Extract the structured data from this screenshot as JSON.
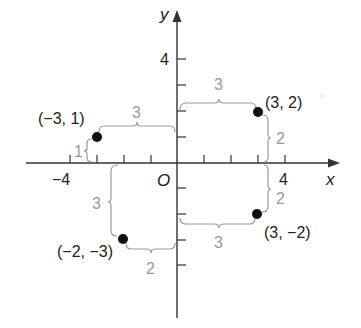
{
  "axes": {
    "x_label": "x",
    "y_label": "y",
    "origin_label": "O",
    "x_tick_labels": [
      {
        "value": -4,
        "text": "−4"
      },
      {
        "value": 4,
        "text": "4"
      }
    ],
    "y_tick_labels": [
      {
        "value": 4,
        "text": "4"
      }
    ],
    "x_range": [
      -5,
      5
    ],
    "y_range": [
      -6,
      5
    ],
    "tick_step": 1
  },
  "points": [
    {
      "x": -3,
      "y": 1,
      "label": "(−3, 1)"
    },
    {
      "x": 3,
      "y": 2,
      "label": "(3, 2)"
    },
    {
      "x": 3,
      "y": -2,
      "label": "(3, −2)"
    },
    {
      "x": -2,
      "y": -3,
      "label": "(−2, −3)"
    }
  ],
  "distance_labels": {
    "p1_horizontal": "3",
    "p1_vertical": "1",
    "p2_horizontal": "3",
    "p2_vertical": "2",
    "p3_horizontal": "3",
    "p3_vertical": "2",
    "p4_horizontal": "2",
    "p4_vertical": "3"
  },
  "colors": {
    "axis": "#333333",
    "point": "#111111",
    "brace": "#9a9a9a"
  }
}
